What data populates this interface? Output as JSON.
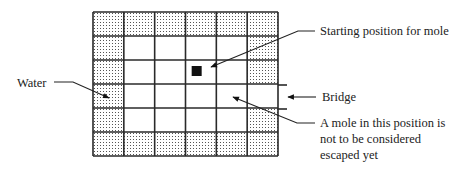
{
  "figure": {
    "type": "grid-map",
    "grid": {
      "columns": 6,
      "rows": 6,
      "cells": [
        [
          "water",
          "water",
          "water",
          "water",
          "water",
          "water"
        ],
        [
          "water",
          "land",
          "land",
          "land",
          "land",
          "water"
        ],
        [
          "water",
          "land",
          "land",
          "mole",
          "land",
          "water"
        ],
        [
          "water",
          "land",
          "land",
          "land",
          "land",
          "bridge"
        ],
        [
          "water",
          "land",
          "land",
          "land",
          "land",
          "water"
        ],
        [
          "water",
          "water",
          "water",
          "water",
          "water",
          "water"
        ]
      ],
      "mole_start": {
        "row": 2,
        "col": 3
      },
      "bridge": {
        "row": 3,
        "col": 5
      },
      "not_escaped_example": {
        "row": 3,
        "col": 4
      }
    },
    "labels": {
      "water": "Water",
      "start": "Starting position for mole",
      "bridge": "Bridge",
      "not_escaped_lines": [
        "A mole  in this position is",
        "not to be considered",
        "escaped yet"
      ]
    }
  }
}
